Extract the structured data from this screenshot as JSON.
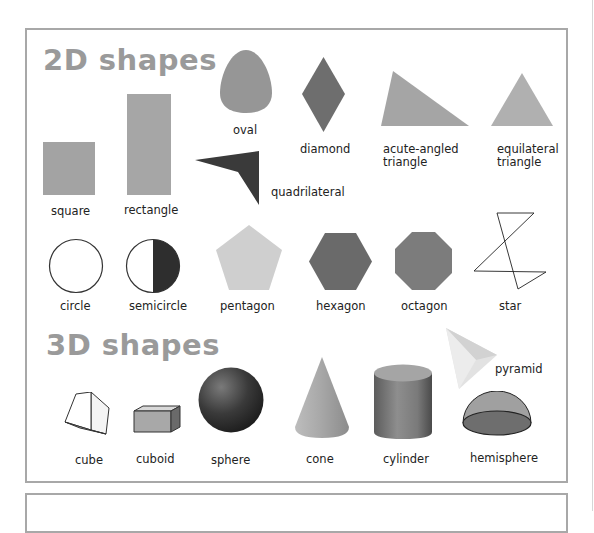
{
  "sections": {
    "two_d": {
      "heading": "2D shapes",
      "shapes": [
        {
          "name": "square",
          "label": "square",
          "color": "#a3a3a3"
        },
        {
          "name": "rectangle",
          "label": "rectangle",
          "color": "#a6a6a6"
        },
        {
          "name": "oval",
          "label": "oval",
          "color": "#969696"
        },
        {
          "name": "quadrilateral",
          "label": "quadrilateral",
          "color": "#3a3a3a"
        },
        {
          "name": "diamond",
          "label": "diamond",
          "color": "#6e6e6e"
        },
        {
          "name": "acute-angled-triangle",
          "label_line1": "acute-angled",
          "label_line2": "triangle",
          "color": "#a5a5a5"
        },
        {
          "name": "equilateral-triangle",
          "label_line1": "equilateral",
          "label_line2": "triangle",
          "color": "#b0b0b0"
        },
        {
          "name": "circle",
          "label": "circle",
          "color": "#ffffff"
        },
        {
          "name": "semicircle",
          "label": "semicircle",
          "color": "#2e2e2e"
        },
        {
          "name": "pentagon",
          "label": "pentagon",
          "color": "#cfcfcf"
        },
        {
          "name": "hexagon",
          "label": "hexagon",
          "color": "#6a6a6a"
        },
        {
          "name": "octagon",
          "label": "octagon",
          "color": "#7c7c7c"
        },
        {
          "name": "star",
          "label": "star",
          "color": "#222222"
        }
      ]
    },
    "three_d": {
      "heading": "3D shapes",
      "shapes": [
        {
          "name": "cube",
          "label": "cube"
        },
        {
          "name": "cuboid",
          "label": "cuboid"
        },
        {
          "name": "sphere",
          "label": "sphere"
        },
        {
          "name": "cone",
          "label": "cone"
        },
        {
          "name": "cylinder",
          "label": "cylinder"
        },
        {
          "name": "pyramid",
          "label": "pyramid"
        },
        {
          "name": "hemisphere",
          "label": "hemisphere"
        }
      ]
    }
  },
  "colors": {
    "frame_border": "#a8a8a8",
    "heading": "#9a9a9a",
    "text": "#222222"
  }
}
